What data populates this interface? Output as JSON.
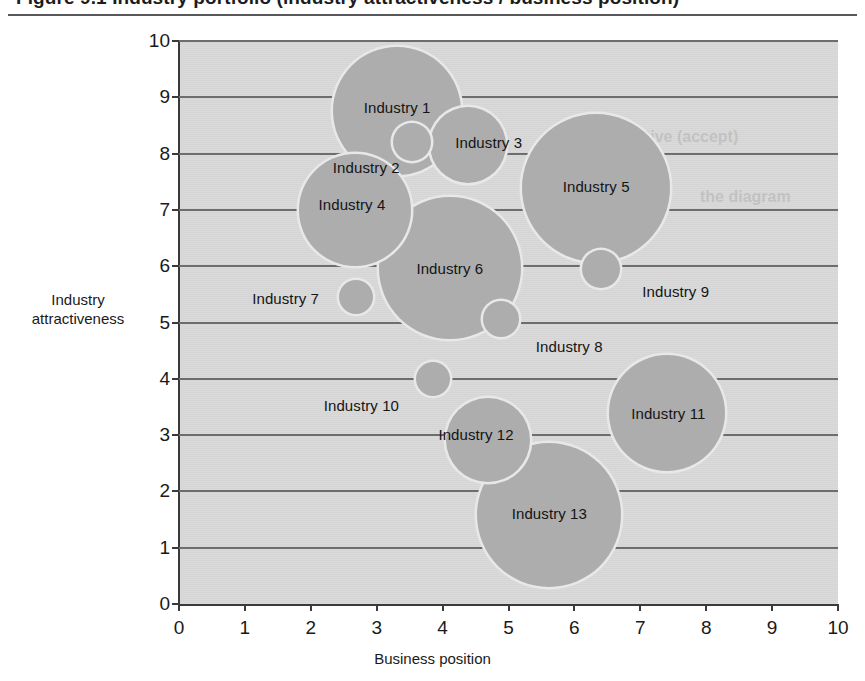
{
  "figure": {
    "title_fragment": "Figure 9.1    Industry portfolio (industry attractiveness / business position)",
    "axis_x_title": "Business position",
    "axis_y_title_line1": "Industry",
    "axis_y_title_line2": "attractiveness"
  },
  "chart_data": {
    "type": "scatter",
    "title": "Industry portfolio",
    "xlabel": "Business position",
    "ylabel": "Industry attractiveness",
    "xlim": [
      0,
      10
    ],
    "ylim": [
      0,
      10
    ],
    "xticks": [
      "0",
      "1",
      "2",
      "3",
      "4",
      "5",
      "6",
      "7",
      "8",
      "9",
      "10"
    ],
    "yticks": [
      "0",
      "1",
      "2",
      "3",
      "4",
      "5",
      "6",
      "7",
      "8",
      "9",
      "10"
    ],
    "grid": "horizontal",
    "legend": "none",
    "bubble_color": "#adadad",
    "plot_background": "#d9d9d9",
    "points": [
      {
        "label": "Industry 1",
        "x": 3.31,
        "y": 8.75,
        "r_px": 64,
        "label_dx": 0,
        "label_dy": -4
      },
      {
        "label": "Industry 2",
        "x": 3.54,
        "y": 8.2,
        "r_px": 19,
        "label_dx": -46,
        "label_dy": 25
      },
      {
        "label": "Industry 3",
        "x": 4.38,
        "y": 8.16,
        "r_px": 38,
        "label_dx": 21,
        "label_dy": -3
      },
      {
        "label": "Industry 4",
        "x": 2.67,
        "y": 7.0,
        "r_px": 56,
        "label_dx": -3,
        "label_dy": -6
      },
      {
        "label": "Industry 5",
        "x": 6.33,
        "y": 7.39,
        "r_px": 74,
        "label_dx": 0,
        "label_dy": -2
      },
      {
        "label": "Industry 6",
        "x": 4.11,
        "y": 5.97,
        "r_px": 71,
        "label_dx": 0,
        "label_dy": 0
      },
      {
        "label": "Industry 7",
        "x": 2.68,
        "y": 5.45,
        "r_px": 17,
        "label_dx": -70,
        "label_dy": 1
      },
      {
        "label": "Industry 8",
        "x": 4.89,
        "y": 5.07,
        "r_px": 18,
        "label_dx": 68,
        "label_dy": 27
      },
      {
        "label": "Industry 9",
        "x": 6.4,
        "y": 5.95,
        "r_px": 19,
        "label_dx": 75,
        "label_dy": 22
      },
      {
        "label": "Industry 10",
        "x": 3.86,
        "y": 4.0,
        "r_px": 17,
        "label_dx": -72,
        "label_dy": 26
      },
      {
        "label": "Industry 11",
        "x": 7.41,
        "y": 3.4,
        "r_px": 58,
        "label_dx": 1,
        "label_dy": 0
      },
      {
        "label": "Industry 12",
        "x": 4.69,
        "y": 2.92,
        "r_px": 42,
        "label_dx": -12,
        "label_dy": -6
      },
      {
        "label": "Industry 13",
        "x": 5.62,
        "y": 1.58,
        "r_px": 72,
        "label_dx": 0,
        "label_dy": -2
      }
    ]
  },
  "ghost_text": [
    {
      "text": "positive (accept)",
      "x": 612,
      "y": 128
    },
    {
      "text": "the diagram",
      "x": 700,
      "y": 188
    }
  ]
}
